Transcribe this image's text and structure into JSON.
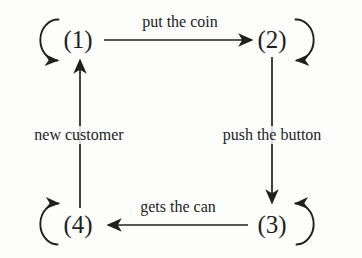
{
  "diagram": {
    "type": "state-transition-diagram",
    "ink_color": "#211f1f",
    "background_color": "#fdfdfc",
    "states": [
      {
        "id": "s1",
        "label": "(1)",
        "x": 78,
        "y": 40,
        "self_loop": "left-open-arrow-bottom"
      },
      {
        "id": "s2",
        "label": "(2)",
        "x": 272,
        "y": 40,
        "self_loop": "right-open-arrow-bottom"
      },
      {
        "id": "s3",
        "label": "(3)",
        "x": 272,
        "y": 225,
        "self_loop": "right-open-arrow-top"
      },
      {
        "id": "s4",
        "label": "(4)",
        "x": 78,
        "y": 225,
        "self_loop": "left-open-arrow-top"
      }
    ],
    "transitions": [
      {
        "id": "t12",
        "from": "(1)",
        "to": "(2)",
        "label": "put the coin",
        "label_x": 180,
        "label_y": 22,
        "direction": "right"
      },
      {
        "id": "t23",
        "from": "(2)",
        "to": "(3)",
        "label": "push the button",
        "label_x": 272,
        "label_y": 135,
        "direction": "down"
      },
      {
        "id": "t34",
        "from": "(3)",
        "to": "(4)",
        "label": "gets the can",
        "label_x": 178,
        "label_y": 207,
        "direction": "left"
      },
      {
        "id": "t41",
        "from": "(4)",
        "to": "(1)",
        "label": "new customer",
        "label_x": 79,
        "label_y": 135,
        "direction": "up"
      }
    ],
    "self_loops": [
      {
        "id": "l1",
        "state": "(1)",
        "description": "self transition on state 1"
      },
      {
        "id": "l2",
        "state": "(2)",
        "description": "self transition on state 2"
      },
      {
        "id": "l3",
        "state": "(3)",
        "description": "self transition on state 3"
      },
      {
        "id": "l4",
        "state": "(4)",
        "description": "self transition on state 4"
      }
    ]
  }
}
